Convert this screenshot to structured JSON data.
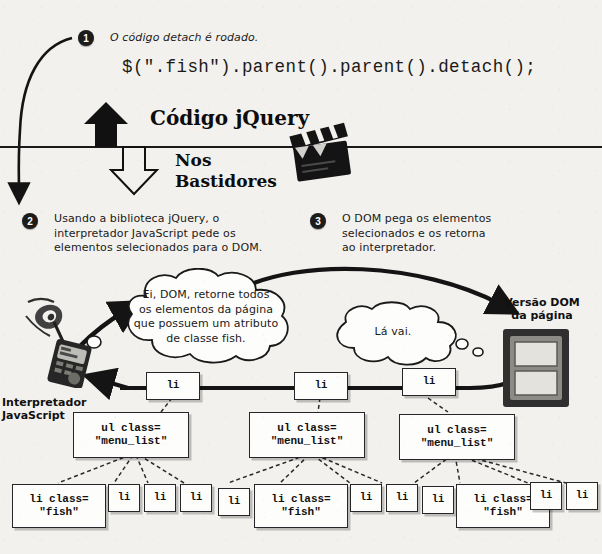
{
  "figure": {
    "title_top_left_step": "1",
    "divider_label_above": "Código jQuery",
    "divider_label_below_line1": "Nos",
    "divider_label_below_line2": "Bastidores"
  },
  "steps": [
    {
      "number": "1",
      "text": "O código detach é rodado."
    },
    {
      "number": "2",
      "text": "Usando a biblioteca jQuery, o interpretador JavaScript pede os elementos selecionados para o DOM.",
      "lines": [
        "Usando a biblioteca jQuery, o",
        "interpretador JavaScript pede os",
        "elementos selecionados para o DOM."
      ]
    },
    {
      "number": "3",
      "text": "O DOM pega os elementos selecionados e os retorna ao interpretador.",
      "lines": [
        "O DOM pega os elementos",
        "selecionados e os retorna",
        "ao interpretador."
      ]
    }
  ],
  "code": {
    "line": "$(\".fish\").parent().parent().detach();"
  },
  "labels": {
    "interpreter_line1": "Interpretador",
    "interpreter_line2": "JavaScript",
    "dom_version_line1": "Versão DOM",
    "dom_version_line2": "da página"
  },
  "bubbles": [
    {
      "name": "request-bubble",
      "lines": [
        "Ei, DOM, retorne todos",
        "os elementos da página",
        "que possuem um atributo",
        "de classe fish."
      ]
    },
    {
      "name": "reply-bubble",
      "lines": [
        "Lá vai."
      ]
    }
  ],
  "tree": {
    "li_row": [
      "li",
      "li",
      "li"
    ],
    "ul_row": [
      {
        "line1": "ul class=",
        "line2": "\"menu_list\""
      },
      {
        "line1": "ul class=",
        "line2": "\"menu_list\""
      },
      {
        "line1": "ul class=",
        "line2": "\"menu_list\""
      }
    ],
    "leaf_row": [
      {
        "type": "fish",
        "line1": "li class=",
        "line2": "\"fish\""
      },
      {
        "type": "plain",
        "line1": "li"
      },
      {
        "type": "plain",
        "line1": "li"
      },
      {
        "type": "plain",
        "line1": "li"
      },
      {
        "type": "plain",
        "line1": "li"
      },
      {
        "type": "fish",
        "line1": "li class=",
        "line2": "\"fish\""
      },
      {
        "type": "plain",
        "line1": "li"
      },
      {
        "type": "plain",
        "line1": "li"
      },
      {
        "type": "plain",
        "line1": "li"
      },
      {
        "type": "fish",
        "line1": "li class=",
        "line2": "\"fish\""
      },
      {
        "type": "plain",
        "line1": "li"
      },
      {
        "type": "plain",
        "line1": "li"
      }
    ]
  },
  "icons": {
    "interpreter": "walkie-talkie-icon",
    "dom": "window-frame-icon",
    "behind_scenes": "clapperboard-icon"
  },
  "colors": {
    "background": "#f3f1ed",
    "ink": "#1a1a1a",
    "node_fill": "#fdfdfb",
    "dom_icon_dark": "#3a3a3a",
    "dom_icon_pane": "#d8d6d2"
  }
}
